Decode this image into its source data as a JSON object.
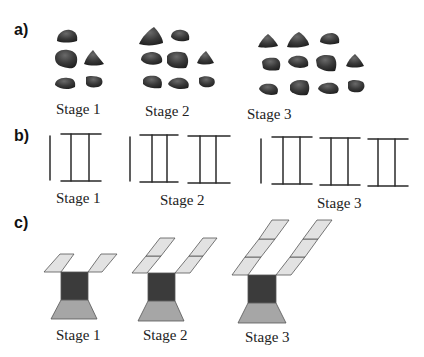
{
  "parts": [
    {
      "label": "a)",
      "description": "Pebble pattern",
      "stages": [
        {
          "label": "Stage 1",
          "pebble_count": 5
        },
        {
          "label": "Stage 2",
          "pebble_count": 8
        },
        {
          "label": "Stage 3",
          "pebble_count": 11
        }
      ]
    },
    {
      "label": "b)",
      "description": "Matchstick ladder pattern",
      "stages": [
        {
          "label": "Stage 1",
          "ladder_units": 1
        },
        {
          "label": "Stage 2",
          "ladder_units": 2
        },
        {
          "label": "Stage 3",
          "ladder_units": 3
        }
      ]
    },
    {
      "label": "c)",
      "description": "Tile pattern with two arms",
      "stages": [
        {
          "label": "Stage 1",
          "tiles_per_arm": 1
        },
        {
          "label": "Stage 2",
          "tiles_per_arm": 2
        },
        {
          "label": "Stage 3",
          "tiles_per_arm": 3
        }
      ]
    }
  ],
  "colors": {
    "pebble": "#3a3a3a",
    "line": "#2a2a2a",
    "arm_tile": "#e2e2e2",
    "body_square": "#3b3b3b",
    "base_trapezoid": "#a6a6a6"
  }
}
